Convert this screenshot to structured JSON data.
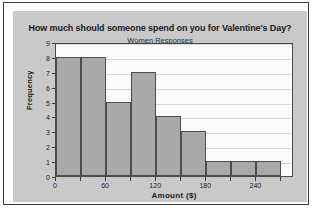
{
  "chart_data": {
    "type": "bar",
    "title": "How much should someone spend on you for Valentine's Day?",
    "subtitle": "Women Responses",
    "xlabel": "Amount ($)",
    "ylabel": "Frequency",
    "bin_width": 30,
    "bin_edges": [
      0,
      30,
      60,
      90,
      120,
      150,
      180,
      210,
      240,
      270
    ],
    "categories": [
      "0-30",
      "30-60",
      "60-90",
      "90-120",
      "120-150",
      "150-180",
      "180-210",
      "210-240",
      "240-270"
    ],
    "values": [
      8,
      8,
      5,
      7,
      4,
      3,
      1,
      1,
      1
    ],
    "xlim": [
      0,
      285
    ],
    "ylim": [
      0,
      9
    ],
    "x_ticks": [
      0,
      60,
      120,
      180,
      240
    ],
    "x_tick_labels": [
      "0",
      "60",
      "120",
      "180",
      "240"
    ],
    "y_ticks": [
      0,
      1,
      2,
      3,
      4,
      5,
      6,
      7,
      8,
      9
    ],
    "y_tick_labels": [
      "0",
      "1",
      "2",
      "3",
      "4",
      "5",
      "6",
      "7",
      "8",
      "9"
    ],
    "grid": true,
    "legend": null,
    "bar_color": "#a9a9a9",
    "bar_border_color": "#4d4d4d",
    "panel_background": "#c9c9c9",
    "plot_background": "#fbfbfb"
  }
}
